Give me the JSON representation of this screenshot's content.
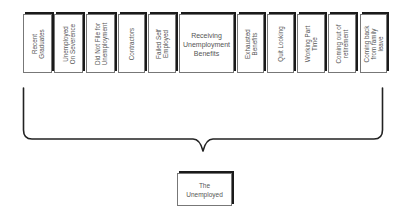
{
  "diagram": {
    "categories": [
      {
        "id": "recent-graduates",
        "label": "Recent\nGraduates",
        "orientation": "vertical"
      },
      {
        "id": "unemployed-on-severance",
        "label": "Unemployed\nOn Severence",
        "orientation": "vertical"
      },
      {
        "id": "did-not-file",
        "label": "Did Not File for\nUnemployment",
        "orientation": "vertical"
      },
      {
        "id": "contractors",
        "label": "Contractors",
        "orientation": "vertical"
      },
      {
        "id": "failed-self-employed",
        "label": "Failed Self\nEmployed",
        "orientation": "vertical"
      },
      {
        "id": "receiving-unemployment-benefits",
        "label": "Receiving\nUnemployment\nBenefits",
        "orientation": "horizontal"
      },
      {
        "id": "exhausted-benefits",
        "label": "Exhausted\nBenefits",
        "orientation": "vertical"
      },
      {
        "id": "quit-looking",
        "label": "Quit Looking",
        "orientation": "vertical"
      },
      {
        "id": "working-part-time",
        "label": "Working Part\nTime",
        "orientation": "vertical"
      },
      {
        "id": "coming-out-of-retirement",
        "label": "Coming out of\nretirement",
        "orientation": "vertical"
      },
      {
        "id": "coming-back-from-family-leave",
        "label": "Coming back\nfrom family\nleave",
        "orientation": "vertical"
      }
    ],
    "result": {
      "label": "The\nUnemployed"
    },
    "colors": {
      "border": "#777777",
      "shadow": "#1a1a1a",
      "brace": "#222222",
      "text": "#555555",
      "background": "#ffffff"
    }
  }
}
